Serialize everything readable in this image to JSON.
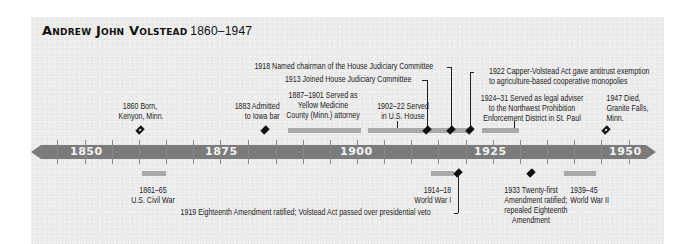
{
  "title": {
    "name": "Andrew John Volstead",
    "years": "1860–1947"
  },
  "colors": {
    "axis": "#7b7b7b",
    "span_bar": "#a9a9a9",
    "marker": "#111111",
    "background": "#ececec"
  },
  "axis": {
    "start": 1845,
    "end": 1955,
    "tick_interval": 5,
    "labels": [
      "1850",
      "1875",
      "1900",
      "1925",
      "1950"
    ]
  },
  "events_above": [
    {
      "id": "born",
      "year": "1860",
      "text_lines": [
        "1860 Born,",
        "Kenyon, Minn."
      ],
      "marker": "hollow-diamond"
    },
    {
      "id": "iowa_bar",
      "year": "1883",
      "text_lines": [
        "1883 Admitted",
        "to Iowa bar"
      ],
      "marker": "diamond"
    },
    {
      "id": "county_attorney",
      "span": "1887–1901",
      "text_lines": [
        "1887–1901 Served as",
        "Yellow Medicine",
        "County (Minn.) attorney"
      ],
      "marker": "span-bar"
    },
    {
      "id": "us_house",
      "span": "1902–22",
      "text_lines": [
        "1902–22 Served",
        "in U.S. House"
      ],
      "marker": "span-bar"
    },
    {
      "id": "judiciary_join",
      "year": "1913",
      "text": "1913 Joined House Judiciary Committee",
      "marker": "diamond"
    },
    {
      "id": "judiciary_chair",
      "year": "1918",
      "text": "1918 Named chairman of the House Judiciary Committee",
      "marker": "diamond"
    },
    {
      "id": "capper_volstead",
      "year": "1922",
      "text_lines": [
        "1922 Capper-Volstead Act gave antitrust exemption",
        "to agriculture-based cooperative monopolies"
      ],
      "marker": "diamond"
    },
    {
      "id": "legal_adviser",
      "span": "1924–31",
      "text_lines": [
        "1924–31 Served as legal adviser",
        "to the Northwest Prohibition",
        "Enforcement District in St. Paul"
      ],
      "marker": "span-bar"
    },
    {
      "id": "died",
      "year": "1947",
      "text_lines": [
        "1947 Died,",
        "Granite Falls,",
        "Minn."
      ],
      "marker": "hollow-diamond"
    }
  ],
  "events_below": [
    {
      "id": "civil_war",
      "span": "1861–65",
      "text_lines": [
        "1861–65",
        "U.S. Civil War"
      ],
      "marker": "span-bar"
    },
    {
      "id": "ww1",
      "span": "1914–18",
      "text_lines": [
        "1914–18",
        "World War I"
      ],
      "marker": "span-bar"
    },
    {
      "id": "eighteenth",
      "year": "1919",
      "text": "1919 Eighteenth Amendment ratified; Volstead Act passed over presidential veto",
      "marker": "diamond"
    },
    {
      "id": "twentyfirst",
      "year": "1933",
      "text_lines": [
        "1933 Twenty-first",
        "Amendment ratified;",
        "repealed Eighteenth",
        "Amendment"
      ],
      "marker": "diamond"
    },
    {
      "id": "ww2",
      "span": "1939–45",
      "text_lines": [
        "1939–45",
        "World War II"
      ],
      "marker": "span-bar"
    }
  ]
}
